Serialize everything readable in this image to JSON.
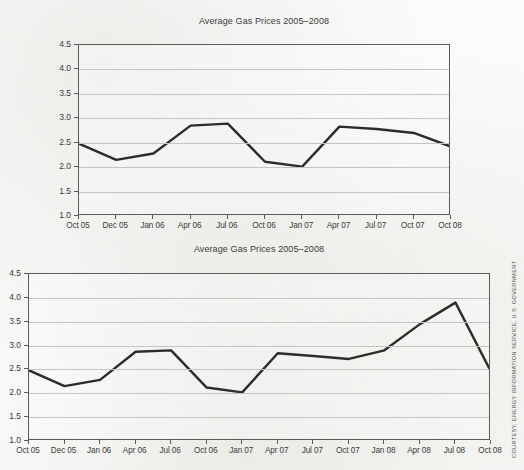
{
  "page": {
    "background_color": "#fbfbfa",
    "credit_text": "COURTESY, ENERGY INFORMATION SERVICE, U.S. GOVERNMENT"
  },
  "style": {
    "line_color": "#2c2c2c",
    "axis_color": "#5a5a5a",
    "grid_color": "#c4c4c0",
    "text_color": "#3a3a3a"
  },
  "chart_data": [
    {
      "id": "top-chart",
      "type": "line",
      "title": "Average Gas Prices 2005–2008",
      "xlabel": "",
      "ylabel": "",
      "ylim": [
        1.0,
        4.5
      ],
      "ytick_values": [
        1.0,
        1.5,
        2.0,
        2.5,
        3.0,
        3.5,
        4.0,
        4.5
      ],
      "ytick_labels": [
        "1.0",
        "1.5",
        "2.0",
        "2.5",
        "3.0",
        "3.5",
        "4.0",
        "4.5"
      ],
      "grid": true,
      "legend": "none",
      "categories": [
        "Oct 05",
        "Dec 05",
        "Jan 06",
        "Apr 06",
        "Jul 06",
        "Oct 06",
        "Jan 07",
        "Apr 07",
        "Jul 07",
        "Oct 07",
        "Oct 08"
      ],
      "values": [
        2.48,
        2.15,
        2.28,
        2.85,
        2.89,
        2.11,
        2.01,
        2.83,
        2.78,
        2.7,
        2.42
      ]
    },
    {
      "id": "bottom-chart",
      "type": "line",
      "title": "Average Gas Prices 2005–2008",
      "xlabel": "",
      "ylabel": "",
      "ylim": [
        1.0,
        4.5
      ],
      "ytick_values": [
        1.0,
        1.5,
        2.0,
        2.5,
        3.0,
        3.5,
        4.0,
        4.5
      ],
      "ytick_labels": [
        "1.0",
        "1.5",
        "2.0",
        "2.5",
        "3.0",
        "3.5",
        "4.0",
        "4.5"
      ],
      "grid": true,
      "legend": "none",
      "categories": [
        "Oct 05",
        "Dec 05",
        "Jan 06",
        "Apr 06",
        "Jul 06",
        "Oct 06",
        "Jan 07",
        "Apr 07",
        "Jul 07",
        "Oct 07",
        "Jan 08",
        "Apr 08",
        "Jul 08",
        "Oct 08"
      ],
      "values": [
        2.48,
        2.15,
        2.28,
        2.87,
        2.9,
        2.12,
        2.02,
        2.84,
        2.78,
        2.72,
        2.9,
        3.45,
        3.9,
        2.45
      ]
    }
  ]
}
